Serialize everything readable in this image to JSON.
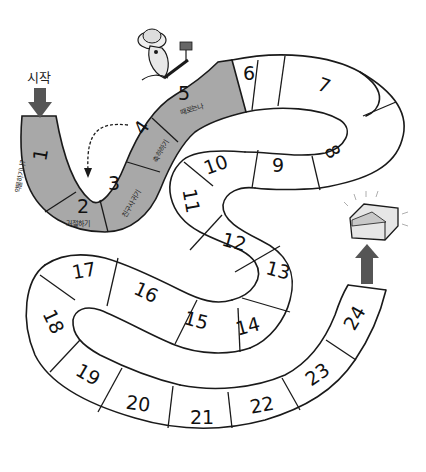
{
  "board": {
    "title": "24-space board game path",
    "colors": {
      "background": "#ffffff",
      "shaded_cell": "#a8a8a8",
      "plain_cell": "#ffffff",
      "outline": "#1a1a1a",
      "arrow": "#555555"
    },
    "start": {
      "label": "시작",
      "icon": "down-arrow-icon"
    },
    "finish": {
      "icon": "treasure-chest-icon",
      "arrow_icon": "up-arrow-icon"
    },
    "character": {
      "icon": "explorer-character-icon",
      "holding": "flag-icon"
    },
    "shortcut": {
      "from": "4",
      "to": "2",
      "style": "dashed-arrow"
    },
    "cells": [
      {
        "number": "1",
        "label": "약물하기나?",
        "shaded": true
      },
      {
        "number": "2",
        "label": "거절하기",
        "shaded": true
      },
      {
        "number": "3",
        "label": "친구사귀기",
        "shaded": true
      },
      {
        "number": "4",
        "label": "축하하기",
        "shaded": true
      },
      {
        "number": "5",
        "label": "때로는나",
        "shaded": true
      },
      {
        "number": "6",
        "label": "",
        "shaded": false
      },
      {
        "number": "7",
        "label": "",
        "shaded": false
      },
      {
        "number": "8",
        "label": "",
        "shaded": false
      },
      {
        "number": "9",
        "label": "",
        "shaded": false
      },
      {
        "number": "10",
        "label": "",
        "shaded": false
      },
      {
        "number": "11",
        "label": "",
        "shaded": false
      },
      {
        "number": "12",
        "label": "",
        "shaded": false
      },
      {
        "number": "13",
        "label": "",
        "shaded": false
      },
      {
        "number": "14",
        "label": "",
        "shaded": false
      },
      {
        "number": "15",
        "label": "",
        "shaded": false
      },
      {
        "number": "16",
        "label": "",
        "shaded": false
      },
      {
        "number": "17",
        "label": "",
        "shaded": false
      },
      {
        "number": "18",
        "label": "",
        "shaded": false
      },
      {
        "number": "19",
        "label": "",
        "shaded": false
      },
      {
        "number": "20",
        "label": "",
        "shaded": false
      },
      {
        "number": "21",
        "label": "",
        "shaded": false
      },
      {
        "number": "22",
        "label": "",
        "shaded": false
      },
      {
        "number": "23",
        "label": "",
        "shaded": false
      },
      {
        "number": "24",
        "label": "",
        "shaded": false
      }
    ]
  }
}
